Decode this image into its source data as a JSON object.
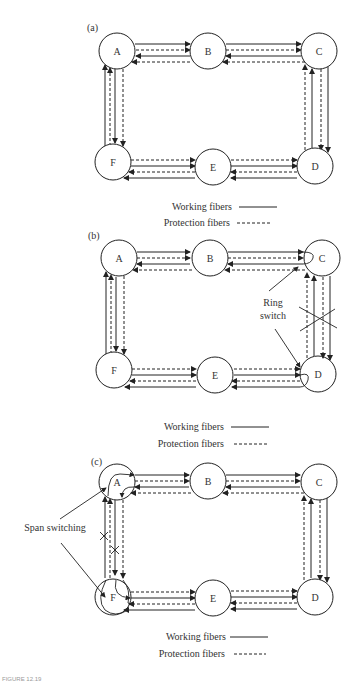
{
  "panels": [
    {
      "id": "a",
      "label": "(a)",
      "nodes": {
        "A": "A",
        "B": "B",
        "C": "C",
        "D": "D",
        "E": "E",
        "F": "F"
      },
      "legend": {
        "working": "Working fibers",
        "protection": "Protection fibers"
      }
    },
    {
      "id": "b",
      "label": "(b)",
      "nodes": {
        "A": "A",
        "B": "B",
        "C": "C",
        "D": "D",
        "E": "E",
        "F": "F"
      },
      "annotation": {
        "line1": "Ring",
        "line2": "switch"
      },
      "legend": {
        "working": "Working fibers",
        "protection": "Protection fibers"
      }
    },
    {
      "id": "c",
      "label": "(c)",
      "nodes": {
        "A": "A",
        "B": "B",
        "C": "C",
        "D": "D",
        "E": "E",
        "F": "F"
      },
      "annotation": {
        "text": "Span switching"
      },
      "legend": {
        "working": "Working fibers",
        "protection": "Protection fibers"
      }
    }
  ],
  "caption": "FIGURE 12.19"
}
